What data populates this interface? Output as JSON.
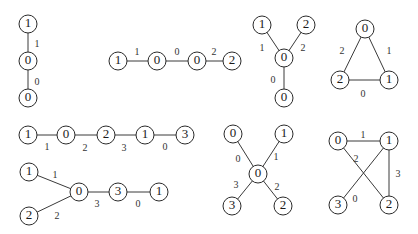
{
  "node_radius": 9,
  "colors": {
    "stroke": "#2a2a2a",
    "edge": "#3a3a3a",
    "text": "#1a1a1a",
    "background": "#ffffff"
  },
  "graphs": [
    {
      "id": "g1",
      "nodes": [
        {
          "x": 28,
          "y": 24,
          "label": "1"
        },
        {
          "x": 28,
          "y": 61,
          "label": "0"
        },
        {
          "x": 28,
          "y": 98,
          "label": "0"
        }
      ],
      "edges": [
        {
          "from": 0,
          "to": 1,
          "label": "1",
          "lx": 37,
          "ly": 45
        },
        {
          "from": 1,
          "to": 2,
          "label": "0",
          "lx": 37,
          "ly": 83
        }
      ]
    },
    {
      "id": "g2",
      "nodes": [
        {
          "x": 118,
          "y": 61,
          "label": "1"
        },
        {
          "x": 157,
          "y": 61,
          "label": "0"
        },
        {
          "x": 197,
          "y": 61,
          "label": "0"
        },
        {
          "x": 232,
          "y": 61,
          "label": "2"
        }
      ],
      "edges": [
        {
          "from": 0,
          "to": 1,
          "label": "1",
          "lx": 137,
          "ly": 53
        },
        {
          "from": 1,
          "to": 2,
          "label": "0",
          "lx": 177,
          "ly": 53
        },
        {
          "from": 2,
          "to": 3,
          "label": "2",
          "lx": 214,
          "ly": 53
        }
      ]
    },
    {
      "id": "g3",
      "nodes": [
        {
          "x": 262,
          "y": 25,
          "label": "1"
        },
        {
          "x": 306,
          "y": 25,
          "label": "2"
        },
        {
          "x": 284,
          "y": 58,
          "label": "0"
        },
        {
          "x": 284,
          "y": 98,
          "label": "0"
        }
      ],
      "edges": [
        {
          "from": 0,
          "to": 2,
          "label": "1",
          "lx": 262,
          "ly": 49
        },
        {
          "from": 1,
          "to": 2,
          "label": "2",
          "lx": 303,
          "ly": 49
        },
        {
          "from": 2,
          "to": 3,
          "label": "0",
          "lx": 273,
          "ly": 81
        }
      ]
    },
    {
      "id": "g4",
      "nodes": [
        {
          "x": 365,
          "y": 29,
          "label": "0"
        },
        {
          "x": 389,
          "y": 80,
          "label": "1"
        },
        {
          "x": 340,
          "y": 80,
          "label": "2"
        }
      ],
      "edges": [
        {
          "from": 0,
          "to": 2,
          "label": "2",
          "lx": 342,
          "ly": 52
        },
        {
          "from": 0,
          "to": 1,
          "label": "1",
          "lx": 389,
          "ly": 52
        },
        {
          "from": 2,
          "to": 1,
          "label": "0",
          "lx": 363,
          "ly": 95
        }
      ]
    },
    {
      "id": "g5",
      "nodes": [
        {
          "x": 28,
          "y": 135,
          "label": "1"
        },
        {
          "x": 66,
          "y": 135,
          "label": "0"
        },
        {
          "x": 106,
          "y": 135,
          "label": "2"
        },
        {
          "x": 145,
          "y": 135,
          "label": "1"
        },
        {
          "x": 185,
          "y": 135,
          "label": "3"
        }
      ],
      "edges": [
        {
          "from": 0,
          "to": 1,
          "label": "1",
          "lx": 47,
          "ly": 148
        },
        {
          "from": 1,
          "to": 2,
          "label": "2",
          "lx": 85,
          "ly": 149
        },
        {
          "from": 2,
          "to": 3,
          "label": "3",
          "lx": 124,
          "ly": 149
        },
        {
          "from": 3,
          "to": 4,
          "label": "0",
          "lx": 165,
          "ly": 148
        }
      ]
    },
    {
      "id": "g6",
      "nodes": [
        {
          "x": 29,
          "y": 172,
          "label": "1"
        },
        {
          "x": 79,
          "y": 192,
          "label": "0"
        },
        {
          "x": 118,
          "y": 192,
          "label": "3"
        },
        {
          "x": 159,
          "y": 192,
          "label": "1"
        },
        {
          "x": 29,
          "y": 216,
          "label": "2"
        }
      ],
      "edges": [
        {
          "from": 0,
          "to": 1,
          "label": "1",
          "lx": 55,
          "ly": 176
        },
        {
          "from": 4,
          "to": 1,
          "label": "2",
          "lx": 57,
          "ly": 217
        },
        {
          "from": 1,
          "to": 2,
          "label": "3",
          "lx": 97,
          "ly": 205
        },
        {
          "from": 2,
          "to": 3,
          "label": "0",
          "lx": 138,
          "ly": 205
        }
      ]
    },
    {
      "id": "g7",
      "nodes": [
        {
          "x": 233,
          "y": 134,
          "label": "0"
        },
        {
          "x": 284,
          "y": 134,
          "label": "1"
        },
        {
          "x": 258,
          "y": 174,
          "label": "0"
        },
        {
          "x": 232,
          "y": 206,
          "label": "3"
        },
        {
          "x": 283,
          "y": 206,
          "label": "2"
        }
      ],
      "edges": [
        {
          "from": 0,
          "to": 2,
          "label": "0",
          "lx": 238,
          "ly": 160
        },
        {
          "from": 1,
          "to": 2,
          "label": "1",
          "lx": 276,
          "ly": 158
        },
        {
          "from": 3,
          "to": 2,
          "label": "3",
          "lx": 236,
          "ly": 186
        },
        {
          "from": 4,
          "to": 2,
          "label": "2",
          "lx": 277,
          "ly": 188
        }
      ]
    },
    {
      "id": "g8",
      "nodes": [
        {
          "x": 338,
          "y": 141,
          "label": "0"
        },
        {
          "x": 389,
          "y": 141,
          "label": "1"
        },
        {
          "x": 338,
          "y": 205,
          "label": "3"
        },
        {
          "x": 389,
          "y": 205,
          "label": "2"
        }
      ],
      "edges": [
        {
          "from": 0,
          "to": 1,
          "label": "1",
          "lx": 363,
          "ly": 136
        },
        {
          "from": 0,
          "to": 3,
          "label": "2",
          "lx": 356,
          "ly": 160,
          "hidden_line": false,
          "to_override": 3
        },
        {
          "from": 1,
          "to": 2,
          "label": "3",
          "lx": 398,
          "ly": 175
        },
        {
          "from": 1,
          "to": 2,
          "label": "0",
          "lx": 355,
          "ly": 200,
          "cross": true
        }
      ],
      "cross_edges": [
        {
          "from": 0,
          "to": 3,
          "label": "2",
          "lx": 356,
          "ly": 160
        },
        {
          "from": 1,
          "to": 2,
          "label": "0",
          "lx": 355,
          "ly": 200
        }
      ]
    }
  ]
}
